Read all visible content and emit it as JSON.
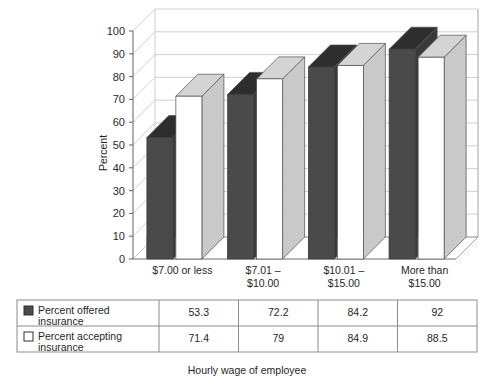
{
  "chart_data": {
    "type": "bar",
    "title": "",
    "subtitle": "",
    "xlabel": "Hourly wage of employee",
    "ylabel": "Percent",
    "ylim": [
      0,
      100
    ],
    "yticks": [
      0,
      10,
      20,
      30,
      40,
      50,
      60,
      70,
      80,
      90,
      100
    ],
    "ytick_labels": [
      "0",
      "10",
      "20",
      "30",
      "40",
      "50",
      "60",
      "70",
      "80",
      "90",
      "100"
    ],
    "grid": true,
    "legend_position": "table-below",
    "style": "3d-clustered-column",
    "categories": [
      "$7.00 or less",
      "$7.01 – $10.00",
      "$10.01 – $15.00",
      "More than $15.00"
    ],
    "category_lines": [
      [
        "$7.00 or less"
      ],
      [
        "$7.01 –",
        "$10.00"
      ],
      [
        "$10.01 –",
        "$15.00"
      ],
      [
        "More than",
        "$15.00"
      ]
    ],
    "series": [
      {
        "name": "Percent offered insurance",
        "values": [
          53.3,
          72.2,
          84.2,
          92
        ],
        "value_labels": [
          "53.3",
          "72.2",
          "84.2",
          "92"
        ],
        "color": "#4a4a4a",
        "top_color": "#2e2e2e",
        "side_color": "#3a3a3a",
        "swatch": "filled"
      },
      {
        "name": "Percent accepting insurance",
        "values": [
          71.4,
          79,
          84.9,
          88.5
        ],
        "value_labels": [
          "71.4",
          "79",
          "84.9",
          "88.5"
        ],
        "color": "#ffffff",
        "top_color": "#d4d4d4",
        "side_color": "#c9c9c9",
        "swatch": "hollow"
      }
    ]
  },
  "colors": {
    "series_offered": "#4a4a4a",
    "series_offered_top": "#2e2e2e",
    "series_accepting": "#ffffff",
    "series_accepting_shade": "#cfcfcf",
    "gridline": "#c9c9c9",
    "axis": "#7a7a7a",
    "table_border": "#8c8c8c",
    "text": "#1f1f1f",
    "background": "#ffffff"
  },
  "data_table": {
    "row_header_column_label": "",
    "column_headers": [
      "$7.00 or less",
      "$7.01 – $10.00",
      "$10.01 – $15.00",
      "More than $15.00"
    ],
    "rows": [
      {
        "swatch": "filled",
        "label_line1": "Percent offered",
        "label_line2": "insurance",
        "values": [
          "53.3",
          "72.2",
          "84.2",
          "92"
        ]
      },
      {
        "swatch": "hollow",
        "label_line1": "Percent accepting",
        "label_line2": "insurance",
        "values": [
          "71.4",
          "79",
          "84.9",
          "88.5"
        ]
      }
    ]
  },
  "footer": {
    "axis_title": "Hourly wage of employee"
  }
}
